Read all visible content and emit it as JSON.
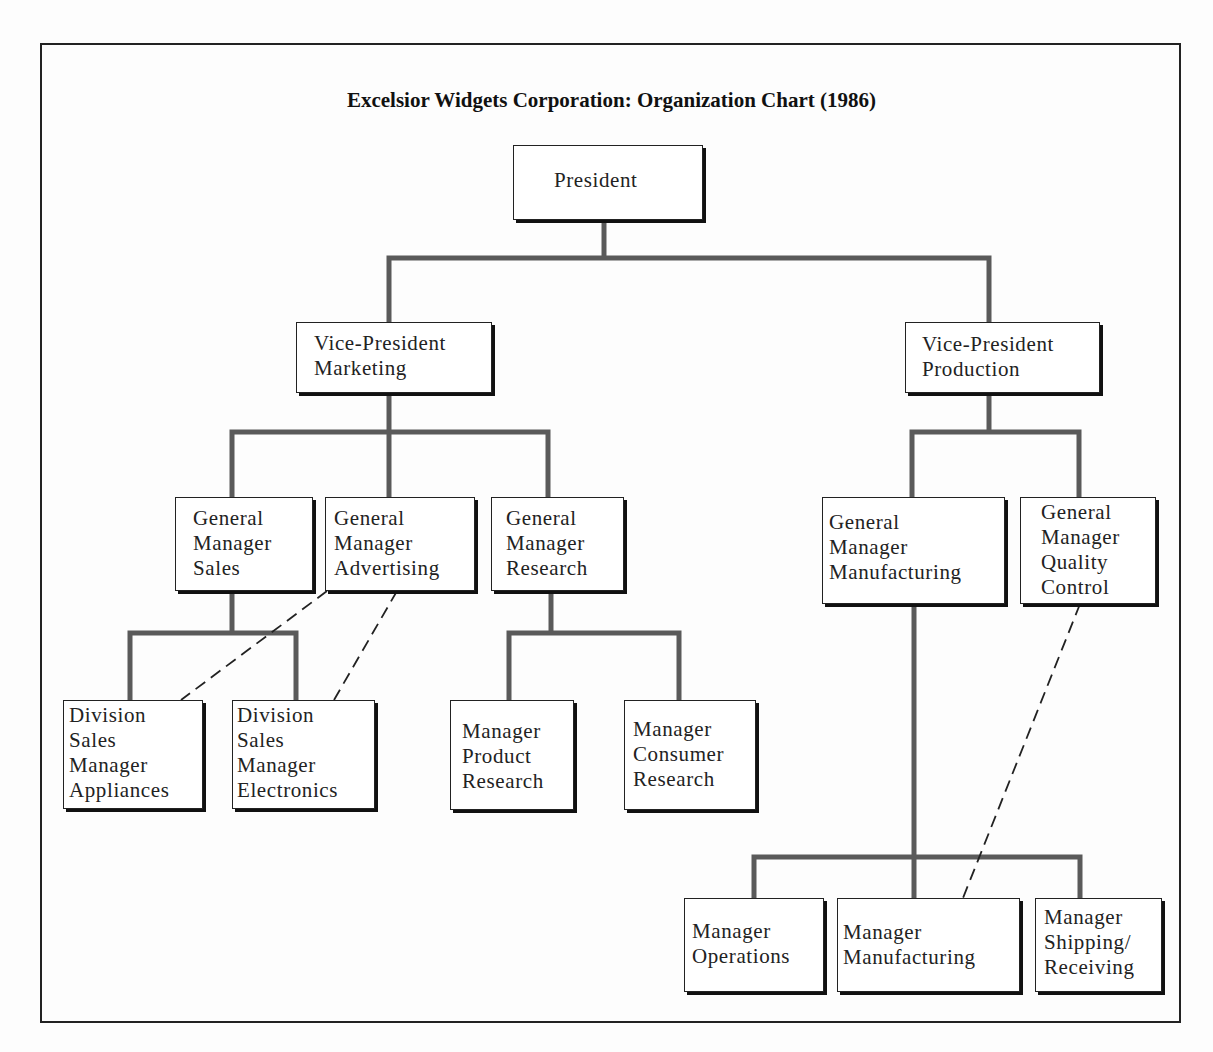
{
  "title": "Excelsior Widgets Corporation: Organization Chart (1986)",
  "colors": {
    "line": "#5a5a5a",
    "box_border": "#222222",
    "dashed": "#222222"
  },
  "nodes": {
    "president": {
      "lines": [
        "President"
      ]
    },
    "vp_marketing": {
      "lines": [
        "Vice-President",
        "Marketing"
      ]
    },
    "vp_production": {
      "lines": [
        "Vice-President",
        "Production"
      ]
    },
    "gm_sales": {
      "lines": [
        "General",
        "Manager",
        "Sales"
      ]
    },
    "gm_advertising": {
      "lines": [
        "General",
        "Manager",
        "Advertising"
      ]
    },
    "gm_research": {
      "lines": [
        "General",
        "Manager",
        "Research"
      ]
    },
    "gm_manufacturing": {
      "lines": [
        "General",
        "Manager",
        "Manufacturing"
      ]
    },
    "gm_quality_control": {
      "lines": [
        "General",
        "Manager",
        "Quality",
        "Control"
      ]
    },
    "dsm_appliances": {
      "lines": [
        "Division",
        "Sales",
        "Manager",
        "Appliances"
      ]
    },
    "dsm_electronics": {
      "lines": [
        "Division",
        "Sales",
        "Manager",
        "Electronics"
      ]
    },
    "mgr_product_research": {
      "lines": [
        "Manager",
        "Product",
        "Research"
      ]
    },
    "mgr_consumer_research": {
      "lines": [
        "Manager",
        "Consumer",
        "Research"
      ]
    },
    "mgr_operations": {
      "lines": [
        "Manager",
        "Operations"
      ]
    },
    "mgr_manufacturing": {
      "lines": [
        "Manager",
        "Manufacturing"
      ]
    },
    "mgr_shipping_receiving": {
      "lines": [
        "Manager",
        "Shipping/",
        "Receiving"
      ]
    }
  },
  "reporting_lines": [
    {
      "from": "president",
      "to": "vp_marketing",
      "type": "solid"
    },
    {
      "from": "president",
      "to": "vp_production",
      "type": "solid"
    },
    {
      "from": "vp_marketing",
      "to": "gm_sales",
      "type": "solid"
    },
    {
      "from": "vp_marketing",
      "to": "gm_advertising",
      "type": "solid"
    },
    {
      "from": "vp_marketing",
      "to": "gm_research",
      "type": "solid"
    },
    {
      "from": "gm_sales",
      "to": "dsm_appliances",
      "type": "solid"
    },
    {
      "from": "gm_sales",
      "to": "dsm_electronics",
      "type": "solid"
    },
    {
      "from": "gm_advertising",
      "to": "dsm_appliances",
      "type": "dashed"
    },
    {
      "from": "gm_advertising",
      "to": "dsm_electronics",
      "type": "dashed"
    },
    {
      "from": "gm_research",
      "to": "mgr_product_research",
      "type": "solid"
    },
    {
      "from": "gm_research",
      "to": "mgr_consumer_research",
      "type": "solid"
    },
    {
      "from": "vp_production",
      "to": "gm_manufacturing",
      "type": "solid"
    },
    {
      "from": "vp_production",
      "to": "gm_quality_control",
      "type": "solid"
    },
    {
      "from": "gm_manufacturing",
      "to": "mgr_operations",
      "type": "solid"
    },
    {
      "from": "gm_manufacturing",
      "to": "mgr_manufacturing",
      "type": "solid"
    },
    {
      "from": "gm_manufacturing",
      "to": "mgr_shipping_receiving",
      "type": "solid"
    },
    {
      "from": "gm_quality_control",
      "to": "mgr_manufacturing",
      "type": "dashed"
    }
  ]
}
